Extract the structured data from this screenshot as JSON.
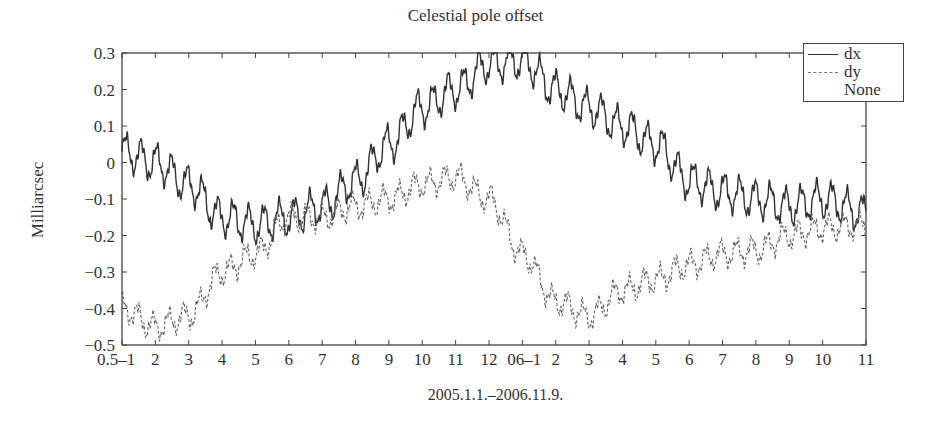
{
  "chart_data": {
    "type": "line",
    "title": "Celestial pole offset",
    "xlabel": "2005.1.1.–2006.11.9.",
    "ylabel": "Milliarcsec",
    "ylim": [
      -0.5,
      0.3
    ],
    "yticks": [
      "0.3",
      "0.2",
      "0.1",
      "0",
      "−0.1",
      "−0.2",
      "−0.3",
      "−0.4",
      "−0.5"
    ],
    "xtick_labels": [
      "0.5–1",
      "2",
      "3",
      "4",
      "5",
      "6",
      "7",
      "8",
      "9",
      "10",
      "11",
      "12",
      "06–1",
      "2",
      "3",
      "4",
      "5",
      "6",
      "7",
      "8",
      "9",
      "10",
      "11"
    ],
    "grid": false,
    "legend_position": "upper right",
    "legend": [
      "dx",
      "dy",
      "None"
    ],
    "x_months": [
      0,
      1,
      2,
      3,
      4,
      5,
      6,
      7,
      8,
      9,
      10,
      11,
      12,
      13,
      14,
      15,
      16,
      17,
      18,
      19,
      20,
      21,
      22.3
    ],
    "series": [
      {
        "name": "dx",
        "style": "solid",
        "values": [
          0.03,
          0.0,
          -0.06,
          -0.15,
          -0.17,
          -0.15,
          -0.12,
          -0.05,
          0.05,
          0.15,
          0.2,
          0.27,
          0.28,
          0.2,
          0.15,
          0.1,
          0.05,
          -0.05,
          -0.08,
          -0.1,
          -0.12,
          -0.1,
          -0.14
        ]
      },
      {
        "name": "dy",
        "style": "dashed",
        "values": [
          -0.4,
          -0.45,
          -0.42,
          -0.3,
          -0.25,
          -0.15,
          -0.15,
          -0.12,
          -0.1,
          -0.06,
          -0.04,
          -0.1,
          -0.25,
          -0.38,
          -0.42,
          -0.35,
          -0.32,
          -0.28,
          -0.25,
          -0.24,
          -0.2,
          -0.18,
          -0.17
        ]
      }
    ]
  },
  "legend": {
    "items": [
      {
        "label": "dx"
      },
      {
        "label": "dy"
      },
      {
        "label": "None"
      }
    ]
  }
}
